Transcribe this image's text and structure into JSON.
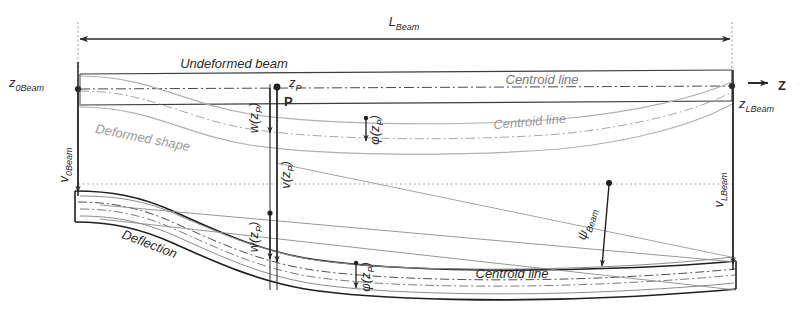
{
  "figure": {
    "domain": "diagram",
    "background_color": "#ffffff",
    "line_color_dark": "#2b2b2b",
    "line_color_mid": "#6f6f6f",
    "line_color_light": "#b4b4b4",
    "label_color": "#3a3a3a"
  },
  "labels": {
    "length_dimension": "L",
    "length_dimension_sub": "Beam",
    "undeformed_beam": "Undeformed beam",
    "deformed_shape": "Deformed shape",
    "deflection": "Deflection",
    "centroid_line_1": "Centroid line",
    "centroid_line_2": "Centroid line",
    "centroid_line_3": "Centroid line",
    "z_origin": "z",
    "z_origin_sub": "0Beam",
    "z_end": "z",
    "z_end_sub": "LBeam",
    "v_origin": "v",
    "v_origin_sub": "0Beam",
    "v_end": "v",
    "v_end_sub": "LBeam",
    "axis_z": "Z",
    "point_p": "P",
    "z_p": "z",
    "z_p_sub": "P",
    "w_zp": "w(z",
    "w_zp_sub": "P",
    "w_zp_close": ")",
    "v_zp": "v(z",
    "v_zp_sub": "P",
    "v_zp_close": ")",
    "phi_zp_upper": "φ(z",
    "phi_zp_upper_sub": "P",
    "phi_zp_upper_close": ")",
    "phi_zp_lower": "φ(z",
    "phi_zp_lower_sub": "P",
    "phi_zp_lower_close": ")",
    "psi_beam": "ψ",
    "psi_beam_sub": "Beam"
  }
}
